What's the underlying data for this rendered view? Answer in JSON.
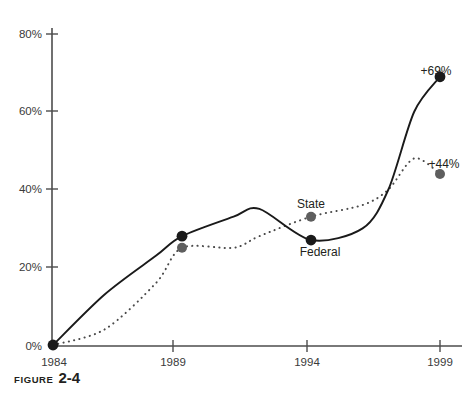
{
  "caption": {
    "word": "FIGURE",
    "number": "2-4"
  },
  "chart_data": {
    "type": "line",
    "title": "",
    "xlabel": "",
    "ylabel": "",
    "xlim": [
      1984,
      1999
    ],
    "ylim": [
      0,
      85
    ],
    "grid": false,
    "legend": "inline-annotations",
    "x_ticks": [
      "1984",
      "1989",
      "1994",
      "1999"
    ],
    "x_tick_values": [
      1984,
      1989,
      1994,
      1999
    ],
    "y_ticks": [
      "0%",
      "20%",
      "40%",
      "60%",
      "80%"
    ],
    "y_tick_values": [
      0,
      20,
      40,
      60,
      80
    ],
    "series": [
      {
        "name": "Federal",
        "style": "solid",
        "color": "#1a1a1a",
        "label": "Federal",
        "end_label": "+69%",
        "x": [
          1984,
          1986,
          1988,
          1989,
          1991,
          1992,
          1994,
          1996,
          1997,
          1998,
          1999
        ],
        "values": [
          0,
          13,
          23,
          28,
          33,
          35,
          27,
          30,
          40,
          60,
          69
        ],
        "markers": [
          {
            "x": 1984,
            "value": 0
          },
          {
            "x": 1989,
            "value": 28
          },
          {
            "x": 1994,
            "value": 27
          },
          {
            "x": 1999,
            "value": 69
          }
        ]
      },
      {
        "name": "State",
        "style": "dotted",
        "color": "#5e5e5e",
        "label": "State",
        "end_label": "+44%",
        "x": [
          1984,
          1986,
          1988,
          1989,
          1991,
          1992,
          1994,
          1996,
          1997,
          1998,
          1999
        ],
        "values": [
          0,
          4,
          16,
          25,
          25,
          28,
          33,
          36,
          40,
          48,
          44
        ],
        "markers": [
          {
            "x": 1989,
            "value": 25
          },
          {
            "x": 1994,
            "value": 33
          },
          {
            "x": 1999,
            "value": 44
          }
        ]
      }
    ],
    "annotations": [
      {
        "text": "State",
        "series": "State",
        "near_x": 1994
      },
      {
        "text": "Federal",
        "series": "Federal",
        "near_x": 1994
      },
      {
        "text": "+69%",
        "series": "Federal",
        "near_x": 1999
      },
      {
        "text": "+44%",
        "series": "State",
        "near_x": 1999
      }
    ]
  }
}
